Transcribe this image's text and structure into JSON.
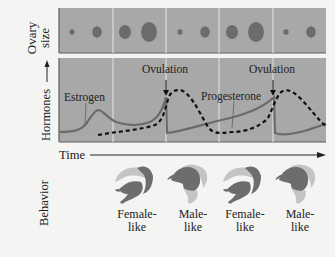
{
  "figure": {
    "panels": {
      "ovary": {
        "axis_label_line1": "Ovary",
        "axis_label_line2": "size",
        "circle_sizes": [
          "tiny",
          "small",
          "medium",
          "large",
          "tiny",
          "small",
          "medium",
          "large",
          "tiny",
          "small"
        ]
      },
      "hormones": {
        "axis_label": "Hormones",
        "series": {
          "estrogen": "Estrogen",
          "progesterone": "Progesterone"
        },
        "events": [
          "Ovulation",
          "Ovulation"
        ]
      },
      "time": {
        "axis_label": "Time"
      },
      "behavior": {
        "axis_label": "Behavior",
        "items": [
          {
            "line1": "Female-",
            "line2": "like"
          },
          {
            "line1": "Male-",
            "line2": "like"
          },
          {
            "line1": "Female-",
            "line2": "like"
          },
          {
            "line1": "Male-",
            "line2": "like"
          }
        ]
      }
    },
    "colors": {
      "panel_bg": "#a8a8a8",
      "panel_border": "#5e5e5e",
      "divider": "#e6e6e6",
      "circle": "#6b6b6b",
      "estrogen_line": "#6a6a6a",
      "progesterone_line": "#111111",
      "lizard_dark": "#6d6d6d",
      "lizard_light": "#c4c4c4"
    }
  }
}
